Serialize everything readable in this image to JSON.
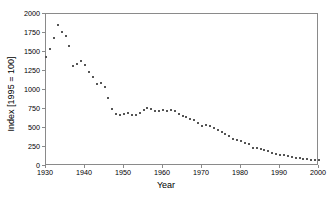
{
  "chart_data": {
    "type": "scatter",
    "title": "",
    "xlabel": "Year",
    "ylabel": "Index [1995 = 100]",
    "xlim": [
      1930,
      2000
    ],
    "ylim": [
      0,
      2000
    ],
    "grid": false,
    "legend": "none",
    "x_ticks": [
      1930,
      1940,
      1950,
      1960,
      1970,
      1980,
      1990,
      2000
    ],
    "x_tick_labels": [
      "1930",
      "1940",
      "1950",
      "1960",
      "1970",
      "1980",
      "1990",
      "2000"
    ],
    "y_ticks": [
      0,
      250,
      500,
      750,
      1000,
      1250,
      1500,
      1750,
      2000
    ],
    "y_tick_labels": [
      "0",
      "250",
      "500",
      "750",
      "1000",
      "1250",
      "1500",
      "1750",
      "2000"
    ],
    "marker": "square",
    "marker_color": "#555555",
    "x": [
      1930,
      1931,
      1932,
      1933,
      1934,
      1935,
      1936,
      1937,
      1938,
      1939,
      1940,
      1941,
      1942,
      1943,
      1944,
      1945,
      1946,
      1947,
      1948,
      1949,
      1950,
      1951,
      1952,
      1953,
      1954,
      1955,
      1956,
      1957,
      1958,
      1959,
      1960,
      1961,
      1962,
      1963,
      1964,
      1965,
      1966,
      1967,
      1968,
      1969,
      1970,
      1971,
      1972,
      1973,
      1974,
      1975,
      1976,
      1977,
      1978,
      1979,
      1980,
      1981,
      1982,
      1983,
      1984,
      1985,
      1986,
      1987,
      1988,
      1989,
      1990,
      1991,
      1992,
      1993,
      1994,
      1995,
      1996,
      1997,
      1998,
      1999,
      2000
    ],
    "y": [
      1440,
      1545,
      1690,
      1850,
      1760,
      1705,
      1580,
      1320,
      1345,
      1380,
      1325,
      1240,
      1170,
      1080,
      1090,
      1035,
      890,
      750,
      680,
      670,
      690,
      700,
      665,
      665,
      700,
      735,
      760,
      750,
      730,
      730,
      735,
      730,
      740,
      720,
      690,
      660,
      650,
      620,
      600,
      560,
      520,
      545,
      520,
      500,
      470,
      450,
      415,
      395,
      360,
      340,
      325,
      300,
      285,
      235,
      240,
      225,
      205,
      195,
      175,
      160,
      150,
      140,
      130,
      120,
      110,
      100,
      95,
      90,
      85,
      80,
      75
    ]
  }
}
